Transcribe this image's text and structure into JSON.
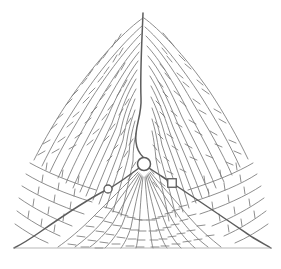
{
  "figure": {
    "title": "",
    "caption": "",
    "background_color": "#ffffff",
    "stroke_color": "#7a7a7a",
    "stroke_color_dark": "#5d5d5d",
    "stroke_color_light": "#9a9a9a"
  },
  "chart_data": {
    "type": "diagram",
    "subtype": "phase-portrait-simplex",
    "title": "",
    "xlabel": "",
    "ylabel": "",
    "grid": false,
    "legend": null,
    "domain_shape": "triangle",
    "triangle_vertices": [
      {
        "name": "apex-top",
        "x": 143,
        "y": 13
      },
      {
        "name": "vertex-bottom-left",
        "x": 14,
        "y": 248
      },
      {
        "name": "vertex-bottom-right",
        "x": 271,
        "y": 248
      }
    ],
    "fixed_points": [
      {
        "name": "interior-equilibrium",
        "marker": "open-circle",
        "x": 144,
        "y": 164,
        "r": 6.5
      },
      {
        "name": "saddle-left",
        "marker": "open-circle",
        "x": 108,
        "y": 189,
        "r": 4.0
      },
      {
        "name": "node-right",
        "marker": "open-square",
        "x": 172,
        "y": 183,
        "size": 8.5
      }
    ],
    "separatrices": [
      {
        "name": "upper-separatrix",
        "from": [
          143,
          13
        ],
        "to": [
          144,
          164
        ]
      },
      {
        "name": "lower-left-separatrix",
        "from": [
          144,
          164
        ],
        "to": [
          14,
          248
        ]
      },
      {
        "name": "lower-right-separatrix",
        "from": [
          144,
          164
        ],
        "to": [
          271,
          248
        ]
      }
    ],
    "flow_direction": "inward toward interior equilibrium",
    "arrow_marker_style": "perpendicular tick / barb"
  }
}
